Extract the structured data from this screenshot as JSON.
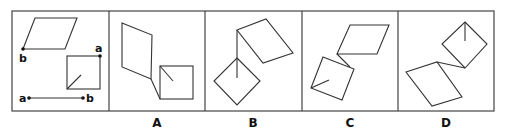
{
  "puzzle": {
    "question_panel": {
      "point_labels": {
        "parallelogram_b": "b",
        "square_a": "a",
        "segment_a": "a",
        "segment_b": "b"
      }
    },
    "options": [
      {
        "label": "A"
      },
      {
        "label": "B"
      },
      {
        "label": "C"
      },
      {
        "label": "D"
      }
    ]
  }
}
